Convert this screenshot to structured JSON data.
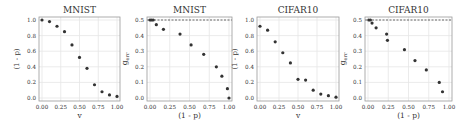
{
  "chart_data": [
    {
      "type": "scatter",
      "title": "MNIST",
      "xlabel": "v",
      "ylabel": "(1 - p)",
      "xlim": [
        0,
        1
      ],
      "ylim": [
        0,
        1
      ],
      "xticks": [
        "0.00",
        "0.25",
        "0.50",
        "0.75",
        "1.00"
      ],
      "yticks": [
        "0.0",
        "0.2",
        "0.4",
        "0.6",
        "0.8",
        "1.0"
      ],
      "ytick_values": [
        0,
        0.2,
        0.4,
        0.6,
        0.8,
        1.0
      ],
      "grid": true,
      "reference_line": null,
      "x": [
        0.0,
        0.1,
        0.2,
        0.3,
        0.4,
        0.5,
        0.6,
        0.7,
        0.8,
        0.9,
        1.0
      ],
      "y": [
        1.0,
        0.98,
        0.92,
        0.85,
        0.68,
        0.52,
        0.38,
        0.17,
        0.08,
        0.04,
        0.02
      ]
    },
    {
      "type": "scatter",
      "title": "MNIST",
      "xlabel": "(1 - p)",
      "ylabel": "g_err",
      "ylabel_main": "g",
      "ylabel_sub": "err",
      "xlim": [
        0,
        1
      ],
      "ylim": [
        0,
        0.5
      ],
      "xticks": [
        "0.00",
        "0.25",
        "0.50",
        "0.75",
        "1.00"
      ],
      "yticks": [
        "0.0",
        "0.1",
        "0.2",
        "0.3",
        "0.4",
        "0.5"
      ],
      "ytick_values": [
        0,
        0.1,
        0.2,
        0.3,
        0.4,
        0.5
      ],
      "grid": true,
      "reference_line": 0.5,
      "x": [
        0.0,
        0.02,
        0.04,
        0.08,
        0.17,
        0.38,
        0.52,
        0.68,
        0.84,
        0.91,
        0.98,
        1.0
      ],
      "y": [
        0.5,
        0.5,
        0.5,
        0.47,
        0.44,
        0.41,
        0.34,
        0.28,
        0.2,
        0.14,
        0.06,
        0.0
      ]
    },
    {
      "type": "scatter",
      "title": "CIFAR10",
      "xlabel": "v",
      "ylabel": "(1 - p)",
      "xlim": [
        0,
        1
      ],
      "ylim": [
        0,
        1
      ],
      "xticks": [
        "0.00",
        "0.25",
        "0.50",
        "0.75",
        "1.00"
      ],
      "yticks": [
        "0.0",
        "0.2",
        "0.4",
        "0.6",
        "0.8",
        "1.0"
      ],
      "ytick_values": [
        0,
        0.2,
        0.4,
        0.6,
        0.8,
        1.0
      ],
      "grid": true,
      "reference_line": null,
      "x": [
        0.0,
        0.1,
        0.2,
        0.3,
        0.4,
        0.5,
        0.6,
        0.7,
        0.8,
        0.9,
        1.0
      ],
      "y": [
        0.92,
        0.87,
        0.72,
        0.58,
        0.45,
        0.24,
        0.23,
        0.1,
        0.05,
        0.03,
        0.01
      ]
    },
    {
      "type": "scatter",
      "title": "CIFAR10",
      "xlabel": "(1 - p)",
      "ylabel": "g_err",
      "ylabel_main": "g",
      "ylabel_sub": "err",
      "xlim": [
        0,
        1
      ],
      "ylim": [
        0,
        0.5
      ],
      "xticks": [
        "0.00",
        "0.25",
        "0.50",
        "0.75",
        "1.00"
      ],
      "yticks": [
        "0.0",
        "0.1",
        "0.2",
        "0.3",
        "0.4",
        "0.5"
      ],
      "ytick_values": [
        0,
        0.1,
        0.2,
        0.3,
        0.4,
        0.5
      ],
      "grid": true,
      "reference_line": 0.5,
      "x": [
        0.01,
        0.03,
        0.05,
        0.1,
        0.23,
        0.24,
        0.45,
        0.58,
        0.72,
        0.88,
        0.92
      ],
      "y": [
        0.5,
        0.5,
        0.48,
        0.45,
        0.41,
        0.37,
        0.31,
        0.24,
        0.18,
        0.1,
        0.04
      ]
    }
  ],
  "layout": {
    "panels": [
      {
        "left": 39,
        "right": 120,
        "top": 17,
        "bottom": 101
      },
      {
        "left": 147,
        "right": 232,
        "top": 17,
        "bottom": 101
      },
      {
        "left": 257,
        "right": 339,
        "top": 17,
        "bottom": 101
      },
      {
        "left": 365,
        "right": 452,
        "top": 17,
        "bottom": 101
      }
    ],
    "colors": {
      "point": "#333333",
      "grid": "#e6e6e6",
      "axis": "#999999",
      "text": "#333333",
      "refline": "#444444"
    }
  }
}
